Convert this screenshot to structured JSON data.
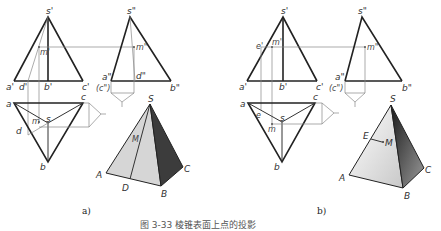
{
  "figure": {
    "caption": "图 3-33  棱锥表面上点的投影",
    "panels": [
      {
        "id": "a",
        "label": "a)",
        "front_view": {
          "apex": "s'",
          "base": [
            "a'",
            "d'",
            "b'",
            "c'"
          ],
          "point": "m'"
        },
        "side_view": {
          "apex": "s\"",
          "base_left": "a\"",
          "base_left_hidden": "(c\")",
          "base_right": "b\"",
          "mid": "d\"",
          "point": "m\""
        },
        "top_view": {
          "vertices": [
            "a",
            "b",
            "c",
            "s"
          ],
          "point": "m",
          "aux": "d"
        },
        "iso_view": {
          "vertices": [
            "S",
            "A",
            "B",
            "C"
          ],
          "point": "M",
          "aux": "D"
        }
      },
      {
        "id": "b",
        "label": "b)",
        "front_view": {
          "apex": "s'",
          "base": [
            "a'",
            "b'",
            "c'"
          ],
          "point": "m'",
          "aux": "e'"
        },
        "side_view": {
          "apex": "s\"",
          "base_left": "a\"",
          "base_left_hidden": "(c\")",
          "base_right": "b\"",
          "point": "m\""
        },
        "top_view": {
          "vertices": [
            "a",
            "b",
            "c",
            "s"
          ],
          "point": "m",
          "aux": "e"
        },
        "iso_view": {
          "vertices": [
            "S",
            "A",
            "B",
            "C"
          ],
          "point": "M",
          "aux": "E"
        }
      }
    ]
  },
  "colors": {
    "line": "#222222",
    "thin": "#888888",
    "face_light": "#d8d8d8",
    "face_dark": "#3a3a3a"
  }
}
